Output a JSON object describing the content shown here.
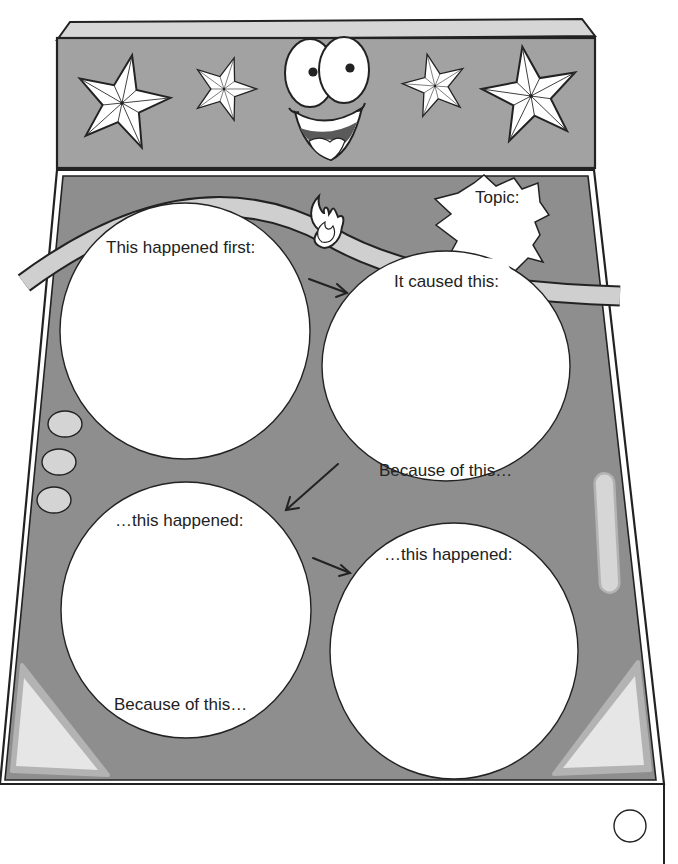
{
  "worksheet": {
    "title": "Cause and Effect Pinball Organizer",
    "topic_label": "Topic:",
    "boxes": [
      {
        "id": "first",
        "heading": "This happened first:",
        "footer": ""
      },
      {
        "id": "caused",
        "heading": "It caused this:",
        "footer": "Because of this…"
      },
      {
        "id": "then1",
        "heading": "…this happened:",
        "footer": "Because of this…"
      },
      {
        "id": "then2",
        "heading": "…this happened:",
        "footer": ""
      }
    ],
    "decorations": {
      "stars": [
        "star-icon",
        "star-icon",
        "star-icon",
        "star-icon"
      ],
      "face": "smiley-face-icon",
      "fire": "flame-icon",
      "arrows": [
        "arrow-right-icon",
        "arrow-down-left-icon",
        "arrow-right-icon"
      ],
      "bumpers": 3
    }
  },
  "colors": {
    "machine_gray": "#8e8e8e",
    "header_gray": "#a2a2a2",
    "light_gray": "#d4d4d4",
    "outline": "#222222",
    "paper": "#ffffff"
  }
}
